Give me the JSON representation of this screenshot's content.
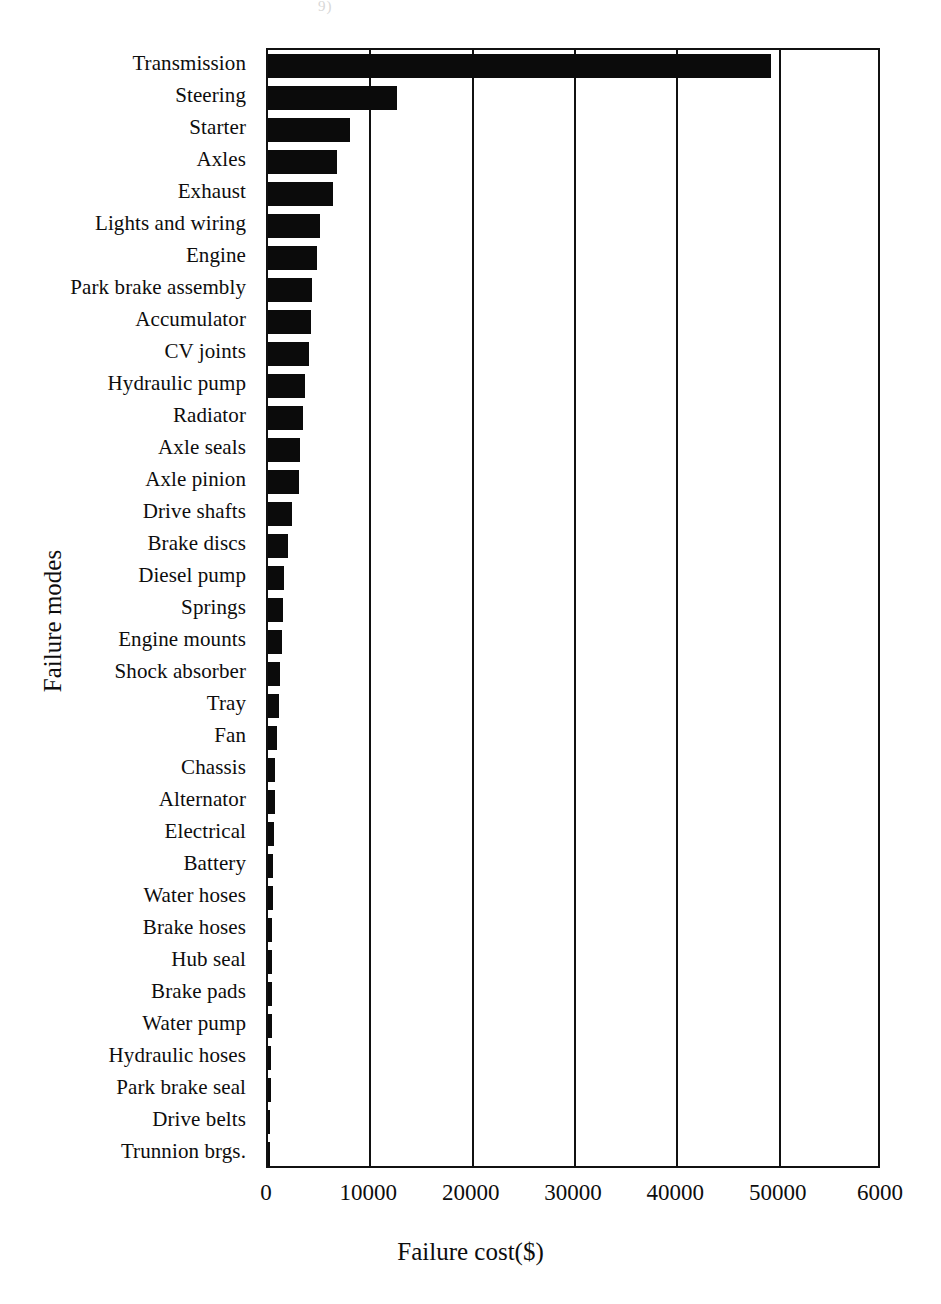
{
  "chart_data": {
    "type": "bar",
    "orientation": "horizontal",
    "title": "",
    "xlabel": "Failure cost($)",
    "ylabel": "Failure modes",
    "xlim": [
      0,
      60000
    ],
    "xticks": [
      "0",
      "10000",
      "20000",
      "30000",
      "40000",
      "50000",
      "6000"
    ],
    "xtick_values": [
      0,
      10000,
      20000,
      30000,
      40000,
      50000,
      60000
    ],
    "grid": "vertical",
    "legend": "none",
    "bar_color": "#0b0b0b",
    "categories": [
      "Transmission",
      "Steering",
      "Starter",
      "Axles",
      "Exhaust",
      "Lights and wiring",
      "Engine",
      "Park brake assembly",
      "Accumulator",
      "CV joints",
      "Hydraulic pump",
      "Radiator",
      "Axle seals",
      "Axle pinion",
      "Drive shafts",
      "Brake discs",
      "Diesel pump",
      "Springs",
      "Engine mounts",
      "Shock absorber",
      "Tray",
      "Fan",
      "Chassis",
      "Alternator",
      "Electrical",
      "Battery",
      "Water hoses",
      "Brake hoses",
      "Hub seal",
      "Brake pads",
      "Water pump",
      "Hydraulic hoses",
      "Park brake seal",
      "Drive belts",
      "Trunnion brgs."
    ],
    "values": [
      49200,
      12600,
      8000,
      6750,
      6350,
      5100,
      4800,
      4300,
      4200,
      4000,
      3600,
      3400,
      3100,
      3050,
      2350,
      1950,
      1600,
      1450,
      1350,
      1200,
      1100,
      850,
      700,
      680,
      600,
      500,
      480,
      430,
      400,
      380,
      360,
      330,
      280,
      230,
      60
    ]
  },
  "top_artifact": "9)"
}
